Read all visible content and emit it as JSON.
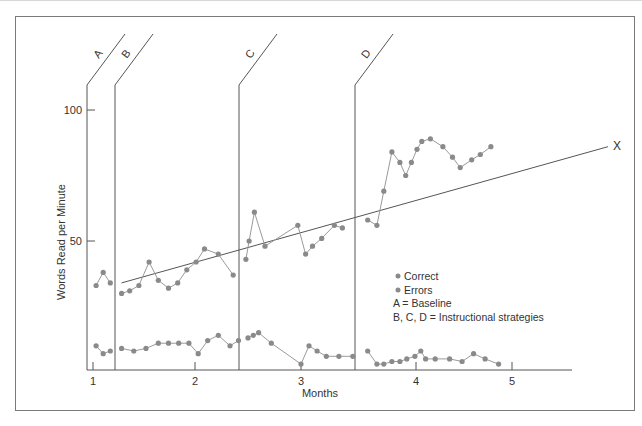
{
  "chart_data": {
    "type": "line",
    "title": "",
    "xlabel": "Months",
    "ylabel": "Words Read per Minute",
    "x_ticks": [
      "1",
      "2",
      "3",
      "4",
      "5"
    ],
    "y_ticks": [
      "50",
      "100"
    ],
    "ylim": [
      0,
      100
    ],
    "xlim": [
      1,
      5.6
    ],
    "grid": false,
    "phases": [
      {
        "label": "A",
        "start_month": 0.95
      },
      {
        "label": "B",
        "start_month": 1.22
      },
      {
        "label": "C",
        "start_month": 2.41
      },
      {
        "label": "D",
        "start_month": 3.52
      }
    ],
    "series": [
      {
        "name": "Correct",
        "segments": [
          {
            "phase": "A",
            "x": [
              1.03,
              1.1,
              1.17
            ],
            "y": [
              33,
              38,
              34
            ]
          },
          {
            "phase": "B",
            "x": [
              1.28,
              1.36,
              1.45,
              1.55,
              1.64,
              1.74,
              1.83,
              1.92,
              2.01,
              2.09,
              2.22,
              2.36
            ],
            "y": [
              30,
              31,
              33,
              42,
              35,
              32,
              34,
              39,
              42,
              47,
              45,
              37
            ]
          },
          {
            "phase": "C",
            "x": [
              2.48,
              2.51,
              2.56,
              2.66,
              2.97,
              3.04,
              3.1,
              3.18,
              3.29,
              3.36
            ],
            "y": [
              43,
              50,
              61,
              48,
              56,
              45,
              48,
              51,
              56,
              55
            ]
          },
          {
            "phase": "D",
            "x": [
              3.58,
              3.66,
              3.72,
              3.79,
              3.86,
              3.91,
              3.96,
              4.01,
              4.06,
              4.15,
              4.28,
              4.38,
              4.46,
              4.58,
              4.67,
              4.78
            ],
            "y": [
              58,
              56,
              69,
              84,
              80,
              75,
              80,
              85,
              88,
              89,
              86,
              82,
              78,
              81,
              83,
              86
            ]
          }
        ]
      },
      {
        "name": "Errors",
        "segments": [
          {
            "phase": "A",
            "x": [
              1.03,
              1.1,
              1.17
            ],
            "y": [
              10,
              7,
              8
            ]
          },
          {
            "phase": "B",
            "x": [
              1.28,
              1.4,
              1.52,
              1.64,
              1.74,
              1.84,
              1.94,
              2.03,
              2.12,
              2.22,
              2.33,
              2.41
            ],
            "y": [
              9,
              8,
              9,
              11,
              11,
              11,
              11,
              7,
              12,
              14,
              10,
              12
            ]
          },
          {
            "phase": "C",
            "x": [
              2.5,
              2.55,
              2.6,
              2.72,
              3.0,
              3.07,
              3.14,
              3.22,
              3.33,
              3.45
            ],
            "y": [
              13,
              14,
              15,
              11,
              3,
              10,
              8,
              6,
              6,
              6
            ]
          },
          {
            "phase": "D",
            "x": [
              3.58,
              3.66,
              3.72,
              3.79,
              3.86,
              3.92,
              3.99,
              4.05,
              4.1,
              4.2,
              4.35,
              4.48,
              4.6,
              4.72,
              4.86
            ],
            "y": [
              8,
              3,
              3,
              4,
              4,
              5,
              6,
              8,
              5,
              5,
              5,
              4,
              7,
              5,
              3
            ]
          }
        ]
      },
      {
        "name": "Trend line",
        "x": [
          1.28,
          5.95
        ],
        "y": [
          34,
          86
        ],
        "end_label": "X"
      }
    ],
    "legend": {
      "position": "inside-right",
      "entries": [
        "Correct",
        "Errors"
      ],
      "notes": [
        "A = Baseline",
        "B, C, D = Instructional strategies"
      ]
    }
  },
  "labels": {
    "xlabel": "Months",
    "ylabel": "Words Read per Minute",
    "trend_end": "X",
    "legend_correct": "Correct",
    "legend_errors": "Errors",
    "legend_note_a": "A = Baseline",
    "legend_note_bcd": "B, C, D = Instructional strategies"
  },
  "style": {
    "dot_color": "#8a8a8a",
    "line_color": "#9a9a9a",
    "axis_color": "#555555",
    "trend_color": "#555555",
    "frame_color": "#7a7a7a"
  }
}
